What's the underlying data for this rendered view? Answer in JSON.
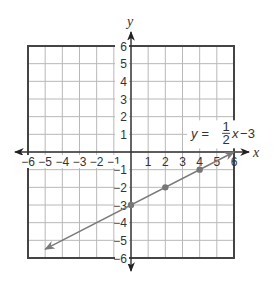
{
  "chart_data": {
    "type": "line",
    "title": "",
    "xlabel": "x",
    "ylabel": "y",
    "xlim": [
      -6,
      6
    ],
    "ylim": [
      -6,
      6
    ],
    "grid": true,
    "x_ticks": [
      -6,
      -5,
      -4,
      -3,
      -2,
      -1,
      1,
      2,
      3,
      4,
      5,
      6
    ],
    "y_ticks": [
      -6,
      -5,
      -4,
      -3,
      -2,
      -1,
      1,
      2,
      3,
      4,
      5,
      6
    ],
    "x_tick_labels": [
      "−6",
      "−5",
      "−4",
      "−3",
      "−2",
      "−1",
      "1",
      "2",
      "3",
      "4",
      "5",
      "6"
    ],
    "y_tick_labels": [
      "−6",
      "−5",
      "−4",
      "−3",
      "−2",
      "−1",
      "1",
      "2",
      "3",
      "4",
      "5",
      "6"
    ],
    "series": [
      {
        "name": "y = 1/2 x - 3",
        "slope": 0.5,
        "intercept": -3,
        "x": [
          -5,
          6
        ],
        "y": [
          -5.5,
          0
        ],
        "arrows": "both",
        "color": "#7a7a7a"
      }
    ],
    "points": [
      {
        "x": 0,
        "y": -3
      },
      {
        "x": 2,
        "y": -2
      },
      {
        "x": 4,
        "y": -1
      }
    ],
    "annotations": [
      {
        "text": "y = 1/2 x − 3",
        "lhs": "y =",
        "numerator": "1",
        "denominator": "2",
        "var": "x",
        "rest": "−3",
        "at": {
          "x": 3.5,
          "y": 1
        }
      }
    ]
  },
  "colors": {
    "grid": "#b8b8b8",
    "border": "#444444",
    "axis": "#333333",
    "line": "#7a7a7a",
    "point": "#777777"
  }
}
